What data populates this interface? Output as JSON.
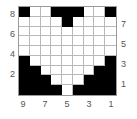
{
  "figure": {
    "title": "",
    "colors": {
      "filled": "#000000",
      "empty": "#ffffff",
      "gridline": "#b9b9b9",
      "frame": "#9a9a9a",
      "tick_text": "#555555"
    }
  },
  "axes": {
    "left": {
      "name": "left-axis",
      "ticks": [
        "8",
        "6",
        "4",
        "2"
      ]
    },
    "right": {
      "name": "right-axis",
      "ticks": [
        "7",
        "5",
        "3",
        "1"
      ]
    },
    "bottom": {
      "name": "bottom-axis",
      "ticks": [
        "9",
        "7",
        "5",
        "3",
        "1"
      ]
    }
  },
  "chart_data": {
    "type": "heatmap",
    "title": "",
    "xlabel": "",
    "ylabel": "",
    "rows": 9,
    "cols": 9,
    "colormap": [
      "#ffffff",
      "#000000"
    ],
    "value_labels": {
      "0": "empty",
      "1": "filled"
    },
    "x": [
      9,
      8,
      7,
      6,
      5,
      4,
      3,
      2,
      1
    ],
    "y": [
      9,
      8,
      7,
      6,
      5,
      4,
      3,
      2,
      1
    ],
    "xlim": [
      9,
      1
    ],
    "ylim": [
      9,
      1
    ],
    "grid": true,
    "legend": "none",
    "xtick_labels": [
      "9",
      "7",
      "5",
      "3",
      "1"
    ],
    "xtick_positions": [
      9,
      7,
      5,
      3,
      1
    ],
    "ytick_labels_left": [
      "8",
      "6",
      "4",
      "2"
    ],
    "ytick_positions_left": [
      8,
      6,
      4,
      2
    ],
    "ytick_labels_right": [
      "7",
      "5",
      "3",
      "1"
    ],
    "ytick_positions_right": [
      7,
      5,
      3,
      1
    ],
    "values": [
      [
        1,
        0,
        0,
        1,
        1,
        1,
        0,
        0,
        1
      ],
      [
        0,
        0,
        0,
        0,
        1,
        0,
        0,
        0,
        0
      ],
      [
        0,
        0,
        0,
        0,
        0,
        0,
        0,
        0,
        0
      ],
      [
        0,
        0,
        0,
        0,
        0,
        0,
        0,
        0,
        0
      ],
      [
        0,
        0,
        0,
        0,
        0,
        0,
        0,
        0,
        0
      ],
      [
        1,
        0,
        0,
        0,
        0,
        0,
        0,
        0,
        1
      ],
      [
        1,
        1,
        0,
        0,
        0,
        0,
        0,
        1,
        1
      ],
      [
        1,
        1,
        1,
        0,
        0,
        0,
        1,
        1,
        1
      ],
      [
        1,
        1,
        1,
        1,
        0,
        1,
        1,
        1,
        1
      ]
    ],
    "row_counts": [
      5,
      1,
      0,
      0,
      0,
      2,
      4,
      6,
      8
    ],
    "column_counts": [
      5,
      4,
      3,
      3,
      2,
      3,
      3,
      4,
      5
    ]
  }
}
